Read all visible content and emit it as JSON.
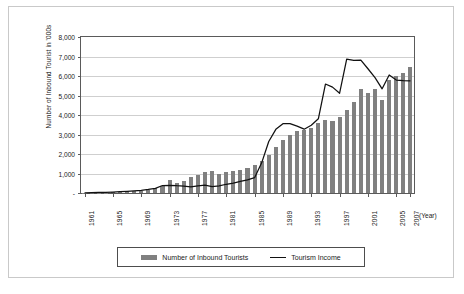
{
  "chart_data": {
    "type": "bar",
    "title": "",
    "xlabel": "(Year)",
    "ylabel": "Number of Inbound Tourist in '000s",
    "ylim": [
      0,
      8000
    ],
    "ytick_labels": [
      "8,000",
      "7,000",
      "6,000",
      "5,000",
      "4,000",
      "3,000",
      "2,000",
      "1,000",
      "-"
    ],
    "ytick_values": [
      8000,
      7000,
      6000,
      5000,
      4000,
      3000,
      2000,
      1000,
      0
    ],
    "grid": true,
    "legend_position": "bottom",
    "x": [
      1961,
      1962,
      1963,
      1964,
      1965,
      1966,
      1967,
      1968,
      1969,
      1970,
      1971,
      1972,
      1973,
      1974,
      1975,
      1976,
      1977,
      1978,
      1979,
      1980,
      1981,
      1982,
      1983,
      1984,
      1985,
      1986,
      1987,
      1988,
      1989,
      1990,
      1991,
      1992,
      1993,
      1994,
      1995,
      1996,
      1997,
      1998,
      1999,
      2000,
      2001,
      2002,
      2003,
      2004,
      2005,
      2006,
      2007
    ],
    "xtick_labels": [
      "1961",
      "1965",
      "1969",
      "1973",
      "1977",
      "1981",
      "1985",
      "1989",
      "1993",
      "1997",
      "2001",
      "2005",
      "2007"
    ],
    "xtick_values": [
      1961,
      1965,
      1969,
      1973,
      1977,
      1981,
      1985,
      1989,
      1993,
      1997,
      2001,
      2005,
      2007
    ],
    "series": [
      {
        "name": "Number of Inbound Tourists",
        "type": "bar",
        "color": "#808080",
        "values": [
          11,
          15,
          22,
          24,
          33,
          67,
          84,
          102,
          126,
          173,
          232,
          370,
          679,
          517,
          633,
          834,
          949,
          1079,
          1126,
          976,
          1093,
          1145,
          1194,
          1298,
          1426,
          1660,
          1975,
          2340,
          2728,
          2959,
          3196,
          3231,
          3331,
          3580,
          3753,
          3684,
          3908,
          4250,
          4660,
          5322,
          5147,
          5347,
          4753,
          5818,
          6023,
          6155,
          6448
        ]
      },
      {
        "name": "Tourism Income",
        "type": "line",
        "color": "#111111",
        "values": [
          12,
          20,
          28,
          35,
          49,
          70,
          85,
          107,
          133,
          180,
          241,
          383,
          396,
          373,
          358,
          315,
          370,
          408,
          326,
          369,
          448,
          502,
          596,
          673,
          784,
          1547,
          2642,
          3265,
          3556,
          3559,
          3426,
          3272,
          3474,
          3806,
          5587,
          5430,
          5116,
          6865,
          6802,
          6811,
          6373,
          5919,
          5343,
          6053,
          5793,
          5760,
          5750
        ]
      }
    ]
  },
  "legend": {
    "items": [
      {
        "label": "Number of Inbound Tourists",
        "marker": "bar-swatch"
      },
      {
        "label": "Tourism Income",
        "marker": "line-swatch"
      }
    ]
  }
}
